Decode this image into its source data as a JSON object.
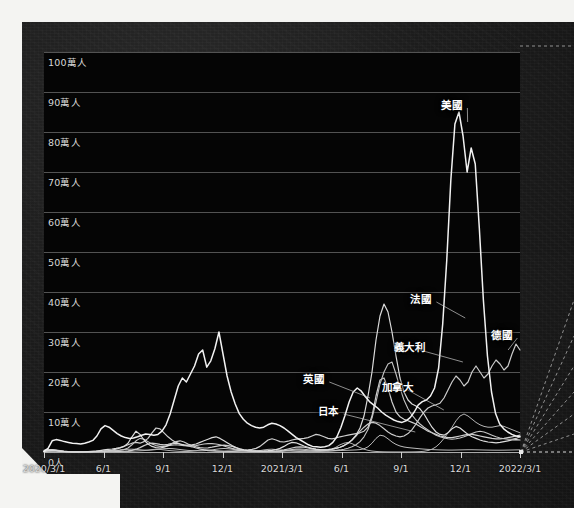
{
  "chart_data": {
    "type": "line",
    "title": "",
    "xlabel": "",
    "ylabel": "",
    "ylim": [
      0,
      1000000
    ],
    "grid": true,
    "legend_position": "inline-annotations",
    "unit": "人",
    "y_ticks": [
      {
        "value": 1000000,
        "label": "100萬人"
      },
      {
        "value": 900000,
        "label": "90萬人"
      },
      {
        "value": 800000,
        "label": "80萬人"
      },
      {
        "value": 700000,
        "label": "70萬人"
      },
      {
        "value": 600000,
        "label": "60萬人"
      },
      {
        "value": 500000,
        "label": "50萬人"
      },
      {
        "value": 400000,
        "label": "40萬人"
      },
      {
        "value": 300000,
        "label": "30萬人"
      },
      {
        "value": 200000,
        "label": "20萬人"
      },
      {
        "value": 100000,
        "label": "10萬人"
      },
      {
        "value": 0,
        "label": "0人"
      }
    ],
    "x_ticks": [
      {
        "pos": 0.0,
        "label": "2020/3/1"
      },
      {
        "pos": 0.125,
        "label": "6/1"
      },
      {
        "pos": 0.25,
        "label": "9/1"
      },
      {
        "pos": 0.375,
        "label": "12/1"
      },
      {
        "pos": 0.5,
        "label": "2021/3/1"
      },
      {
        "pos": 0.625,
        "label": "6/1"
      },
      {
        "pos": 0.75,
        "label": "9/1"
      },
      {
        "pos": 0.875,
        "label": "12/1"
      },
      {
        "pos": 1.0,
        "label": "2022/3/1"
      }
    ],
    "x_range": [
      "2020/3/1",
      "2022/3/1"
    ],
    "series": [
      {
        "name": "美國",
        "color": "#f2f2f2",
        "width": 1.5,
        "peak_value": 850000,
        "peak_label": "2022/1",
        "values": [
          2000,
          9000,
          28000,
          31000,
          29000,
          26000,
          24000,
          22000,
          21000,
          20000,
          22000,
          25000,
          29000,
          40000,
          58000,
          66000,
          62000,
          54000,
          46000,
          40000,
          36000,
          34000,
          35000,
          38000,
          42000,
          45000,
          44000,
          42000,
          44000,
          52000,
          68000,
          95000,
          130000,
          165000,
          185000,
          175000,
          195000,
          215000,
          245000,
          255000,
          212000,
          228000,
          258000,
          300000,
          245000,
          190000,
          150000,
          120000,
          96000,
          82000,
          72000,
          66000,
          62000,
          60000,
          62000,
          68000,
          72000,
          70000,
          66000,
          60000,
          52000,
          44000,
          36000,
          30000,
          24000,
          18000,
          14000,
          13000,
          12000,
          13000,
          16000,
          24000,
          38000,
          62000,
          92000,
          125000,
          150000,
          160000,
          152000,
          138000,
          126000,
          118000,
          110000,
          100000,
          92000,
          86000,
          80000,
          76000,
          74000,
          78000,
          86000,
          100000,
          118000,
          126000,
          130000,
          140000,
          160000,
          210000,
          320000,
          480000,
          680000,
          820000,
          850000,
          790000,
          700000,
          760000,
          720000,
          560000,
          380000,
          240000,
          150000,
          96000,
          70000,
          58000,
          50000,
          44000,
          40000,
          38000
        ]
      },
      {
        "name": "法國",
        "color": "#dcdcdc",
        "width": 1.2,
        "peak_value": 370000,
        "peak_label": "2022/1",
        "values": [
          1000,
          3500,
          4500,
          3800,
          2400,
          1200,
          700,
          500,
          450,
          420,
          500,
          700,
          1100,
          2000,
          3500,
          5200,
          6500,
          7500,
          9000,
          11000,
          14000,
          22000,
          38000,
          52000,
          44000,
          30000,
          20000,
          14000,
          11000,
          10000,
          12000,
          16000,
          20000,
          22000,
          20000,
          18000,
          17000,
          18000,
          20000,
          24000,
          28000,
          32000,
          36000,
          38000,
          34000,
          28000,
          22000,
          16000,
          11000,
          7000,
          5000,
          3600,
          3000,
          2600,
          2400,
          2600,
          3200,
          4200,
          6000,
          9000,
          14000,
          20000,
          24000,
          23000,
          19000,
          15000,
          12000,
          9000,
          7000,
          6000,
          5500,
          6000,
          7000,
          9000,
          12000,
          16000,
          22000,
          30000,
          42000,
          60000,
          90000,
          140000,
          200000,
          280000,
          340000,
          370000,
          350000,
          300000,
          240000,
          185000,
          150000,
          130000,
          120000,
          115000,
          108000,
          95000,
          78000,
          62000,
          50000,
          44000,
          42000,
          48000,
          58000,
          64000,
          60000,
          52000,
          44000,
          38000,
          34000,
          30000,
          27000,
          25000,
          24000,
          23000,
          24000,
          26000,
          28000,
          30000,
          31000,
          30000
        ]
      },
      {
        "name": "德國",
        "color": "#cccccc",
        "width": 1.2,
        "peak_value": 270000,
        "peak_label": "2022/2-3",
        "values": [
          1800,
          5500,
          6000,
          4200,
          2200,
          1100,
          600,
          400,
          350,
          330,
          380,
          500,
          700,
          1000,
          1400,
          1800,
          2100,
          2000,
          1800,
          1700,
          1900,
          2600,
          4200,
          7000,
          11000,
          16000,
          20000,
          22000,
          21000,
          19000,
          18000,
          19000,
          22000,
          26000,
          28000,
          25000,
          20000,
          16000,
          13000,
          11000,
          10000,
          10500,
          12000,
          14000,
          16000,
          17000,
          16000,
          14000,
          11000,
          8000,
          5500,
          3800,
          2800,
          2200,
          1900,
          1800,
          1900,
          2100,
          2600,
          3600,
          5200,
          7500,
          10000,
          12000,
          13000,
          12000,
          10000,
          8000,
          6500,
          5500,
          5200,
          5800,
          7000,
          9000,
          12000,
          16000,
          22000,
          30000,
          40000,
          52000,
          62000,
          70000,
          74000,
          72000,
          66000,
          58000,
          50000,
          44000,
          40000,
          38000,
          40000,
          46000,
          56000,
          70000,
          86000,
          100000,
          110000,
          115000,
          118000,
          122000,
          135000,
          155000,
          175000,
          190000,
          180000,
          165000,
          175000,
          200000,
          215000,
          200000,
          185000,
          195000,
          215000,
          230000,
          220000,
          205000,
          215000,
          245000,
          270000,
          255000
        ]
      },
      {
        "name": "義大利",
        "color": "#c4c4c4",
        "width": 1.1,
        "peak_value": 225000,
        "peak_label": "2022/1",
        "values": [
          4500,
          6200,
          5500,
          4200,
          2800,
          1400,
          700,
          400,
          300,
          250,
          230,
          260,
          320,
          450,
          700,
          1100,
          1700,
          2400,
          3200,
          4200,
          6000,
          10000,
          18000,
          28000,
          34000,
          32000,
          26000,
          20000,
          16000,
          14000,
          14000,
          16000,
          17000,
          18000,
          17000,
          16000,
          15000,
          15000,
          16000,
          18000,
          20000,
          21000,
          21000,
          20000,
          18000,
          15000,
          12000,
          9000,
          7000,
          5500,
          4200,
          3200,
          2400,
          1900,
          1500,
          1300,
          1200,
          1300,
          1600,
          2200,
          3200,
          4600,
          6200,
          7200,
          7400,
          6800,
          5800,
          4800,
          4000,
          3400,
          3000,
          2900,
          3200,
          4000,
          5200,
          7000,
          9500,
          13000,
          18000,
          26000,
          38000,
          56000,
          85000,
          125000,
          170000,
          200000,
          220000,
          225000,
          195000,
          160000,
          130000,
          108000,
          92000,
          80000,
          70000,
          62000,
          55000,
          48000,
          42000,
          38000,
          35000,
          33000,
          32000,
          33000,
          35000,
          38000,
          42000,
          46000,
          50000,
          52000,
          50000,
          46000,
          42000,
          38000,
          35000,
          33000,
          32000,
          32000,
          34000,
          38000
        ]
      },
      {
        "name": "英國",
        "color": "#d0d0d0",
        "width": 1.2,
        "peak_value": 185000,
        "peak_label": "2022/1",
        "values": [
          1200,
          4200,
          5000,
          4500,
          3500,
          2200,
          1200,
          700,
          550,
          600,
          800,
          1100,
          1500,
          1900,
          2200,
          2600,
          3400,
          4800,
          7000,
          10000,
          14000,
          18000,
          22000,
          24000,
          22000,
          26000,
          34000,
          48000,
          60000,
          58000,
          48000,
          38000,
          30000,
          24000,
          20000,
          17000,
          15000,
          13000,
          10000,
          7500,
          5200,
          3600,
          2600,
          2100,
          1900,
          1900,
          2100,
          2400,
          2800,
          3400,
          4200,
          5200,
          6500,
          9000,
          14000,
          22000,
          30000,
          33000,
          30000,
          26000,
          25000,
          27000,
          30000,
          32000,
          33000,
          34000,
          36000,
          40000,
          44000,
          42000,
          38000,
          34000,
          33000,
          35000,
          38000,
          40000,
          42000,
          44000,
          46000,
          48000,
          52000,
          62000,
          90000,
          140000,
          180000,
          185000,
          160000,
          125000,
          100000,
          88000,
          82000,
          78000,
          74000,
          70000,
          64000,
          58000,
          52000,
          48000,
          44000,
          40000,
          38000,
          36000,
          36000,
          38000,
          40000,
          42000,
          44000,
          44000,
          42000,
          40000,
          38000,
          36000,
          34000,
          33000,
          33000,
          34000,
          36000,
          38000,
          40000,
          42000
        ]
      },
      {
        "name": "加拿大",
        "color": "#bcbcbc",
        "width": 1.0,
        "peak_value": 42000,
        "peak_label": "2022/1",
        "values": [
          200,
          900,
          1700,
          1800,
          1500,
          1100,
          700,
          450,
          380,
          400,
          450,
          550,
          700,
          900,
          1200,
          1600,
          2200,
          3000,
          4000,
          5000,
          6000,
          6800,
          7000,
          6500,
          5500,
          4800,
          4600,
          5000,
          6000,
          7200,
          8200,
          8800,
          8500,
          7500,
          6200,
          5000,
          4000,
          3400,
          3000,
          2900,
          3200,
          4000,
          5200,
          6800,
          8200,
          8800,
          8200,
          7000,
          5500,
          4000,
          2800,
          1900,
          1400,
          1000,
          800,
          700,
          650,
          700,
          900,
          1300,
          2000,
          3000,
          4000,
          4500,
          4400,
          3900,
          3300,
          2800,
          2400,
          2200,
          2200,
          2400,
          2800,
          3200,
          3600,
          4000,
          4400,
          4800,
          5200,
          6000,
          8000,
          13000,
          22000,
          34000,
          42000,
          40000,
          33000,
          25000,
          19000,
          15000,
          12500,
          11000,
          10000,
          9000,
          8000,
          7200,
          6500,
          6000,
          5600,
          5200,
          5000,
          4800,
          4800,
          5000,
          5200,
          5400,
          5600,
          5600,
          5400,
          5200,
          5000,
          4800,
          4600,
          4500,
          4500,
          4600,
          4800,
          5000,
          5200,
          5400
        ]
      },
      {
        "name": "日本",
        "color": "#b4b4b4",
        "width": 1.0,
        "peak_value": 95000,
        "peak_label": "2022/2",
        "values": [
          80,
          250,
          450,
          400,
          300,
          200,
          120,
          90,
          120,
          250,
          600,
          1200,
          1500,
          1300,
          1000,
          800,
          600,
          500,
          450,
          500,
          700,
          1200,
          2000,
          2600,
          3000,
          3500,
          4500,
          6000,
          7000,
          6500,
          5200,
          4000,
          3000,
          2200,
          1600,
          1300,
          1400,
          2000,
          3200,
          4800,
          5600,
          5200,
          4200,
          3200,
          2400,
          1800,
          1400,
          1100,
          900,
          800,
          800,
          1000,
          1400,
          2200,
          3600,
          5200,
          6500,
          7000,
          6200,
          5000,
          3800,
          2800,
          2000,
          1500,
          1200,
          1000,
          900,
          900,
          1100,
          1600,
          2600,
          4500,
          7500,
          12000,
          18000,
          22000,
          24000,
          21000,
          16000,
          11000,
          7000,
          4200,
          2400,
          1400,
          800,
          450,
          300,
          220,
          180,
          170,
          180,
          220,
          300,
          500,
          900,
          1800,
          3600,
          7000,
          13000,
          22000,
          34000,
          48000,
          62000,
          78000,
          90000,
          95000,
          90000,
          82000,
          74000,
          68000,
          64000,
          62000,
          62000,
          64000,
          66000,
          64000,
          60000,
          56000,
          52000,
          48000
        ]
      }
    ],
    "annotations": [
      {
        "label": "美國",
        "x_pct": 86.0,
        "y_pct": 13.0,
        "anchor_x_pct": 89.0,
        "anchor_y_pct": 17.5
      },
      {
        "label": "法國",
        "x_pct": 79.5,
        "y_pct": 61.5,
        "anchor_x_pct": 88.5,
        "anchor_y_pct": 66.5
      },
      {
        "label": "德國",
        "x_pct": 96.5,
        "y_pct": 70.5,
        "anchor_x_pct": 97.5,
        "anchor_y_pct": 74.5
      },
      {
        "label": "義大利",
        "x_pct": 76.0,
        "y_pct": 73.5,
        "anchor_x_pct": 88.0,
        "anchor_y_pct": 77.5
      },
      {
        "label": "英國",
        "x_pct": 57.0,
        "y_pct": 81.5,
        "anchor_x_pct": 68.5,
        "anchor_y_pct": 86.5
      },
      {
        "label": "加拿大",
        "x_pct": 73.5,
        "y_pct": 83.5,
        "anchor_x_pct": 84.0,
        "anchor_y_pct": 89.5
      },
      {
        "label": "日本",
        "x_pct": 60.0,
        "y_pct": 89.5,
        "anchor_x_pct": 78.0,
        "anchor_y_pct": 95.0
      }
    ]
  },
  "overlay": {
    "fan_lines": 7,
    "origin_label": "plot-bottom-right"
  }
}
